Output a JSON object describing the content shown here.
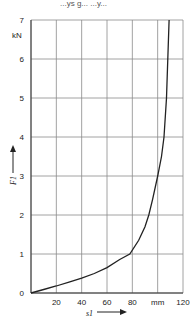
{
  "header_fragment": "...ys  g... ...y...",
  "chart_data": {
    "type": "line",
    "title": "",
    "xlabel": "s1",
    "ylabel": "F1",
    "x_unit": "mm",
    "y_unit": "kN",
    "xlim": [
      0,
      120
    ],
    "ylim": [
      0,
      7
    ],
    "x_ticks": [
      "20",
      "40",
      "60",
      "80",
      "mm",
      "120"
    ],
    "y_ticks": [
      "0",
      "1",
      "2",
      "3",
      "4",
      "5",
      "6",
      "7"
    ],
    "y_zero_label": "0",
    "grid": true,
    "legend": null,
    "series": [
      {
        "name": "F1 vs s1",
        "x": [
          0,
          10,
          20,
          30,
          40,
          50,
          60,
          70,
          78,
          85,
          90,
          93,
          96,
          100,
          103,
          105,
          107,
          109
        ],
        "y": [
          0,
          0.09,
          0.18,
          0.28,
          0.38,
          0.5,
          0.65,
          0.86,
          1.0,
          1.35,
          1.7,
          2.0,
          2.4,
          3.0,
          3.5,
          4.0,
          5.0,
          7.0
        ]
      }
    ],
    "color": "#222222"
  }
}
